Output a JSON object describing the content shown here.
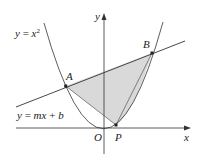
{
  "figure": {
    "axes": {
      "x_label": "x",
      "y_label": "y",
      "origin_label": "O"
    },
    "curve_label": {
      "lhs": "y",
      "eq": " = ",
      "base": "x",
      "exp": "2"
    },
    "line_label": {
      "lhs": "y",
      "eq": " = ",
      "m": "mx",
      "plus": " + ",
      "b": "b"
    },
    "points": {
      "A": "A",
      "B": "B",
      "P": "P"
    },
    "colors": {
      "stroke": "#333333",
      "fill": "#d9d9d9",
      "background": "#ffffff"
    }
  }
}
